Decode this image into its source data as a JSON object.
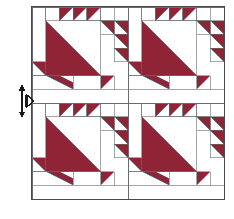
{
  "figure": {
    "background_color": "#ffffff"
  },
  "colors": {
    "fabric_dark": "#8f2437",
    "fabric_light": "#ffffff",
    "seam_line": "#6b6b6b",
    "outer_border": "#4a4a4a",
    "annotation": "#1a1a1a"
  },
  "quilt": {
    "name": "sawtooth-basket-block-set",
    "rows": 2,
    "columns": 2,
    "block_count": 4,
    "block_grid_units": 7,
    "origin": {
      "x": 32,
      "y": 7
    },
    "block_size": 96,
    "blocks": [
      {
        "id": "block-top-left",
        "row": 0,
        "col": 0
      },
      {
        "id": "block-top-right",
        "row": 0,
        "col": 1
      },
      {
        "id": "block-bottom-left",
        "row": 1,
        "col": 0
      },
      {
        "id": "block-bottom-right",
        "row": 1,
        "col": 1
      }
    ]
  },
  "block_pattern": {
    "name": "sawtooth-basket",
    "unit_grid": 7,
    "top_sawtooth_count": 3,
    "right_sawtooth_count": 3,
    "center_triangle": "half-square-triangle-dark-lower-left",
    "has_stem": true,
    "base": "plain-light-rectangle"
  },
  "annotation": {
    "arrow": {
      "name": "height-measure-arrow",
      "type": "double-headed-vertical",
      "x": 22,
      "y_top": 84,
      "y_bottom": 118,
      "label": ""
    },
    "pointer": {
      "name": "edge-pointer-marker",
      "type": "right-chevron",
      "x": 33,
      "y": 101,
      "label": ""
    }
  }
}
